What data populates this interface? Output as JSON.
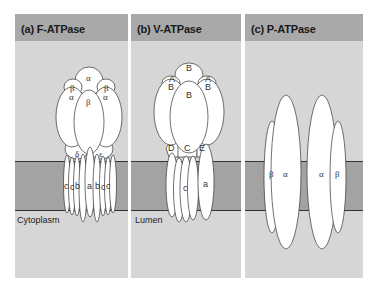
{
  "figure": {
    "panels": [
      {
        "id": "a",
        "title": "(a) F-ATPase",
        "side_label": "Cytoplasm",
        "subunits": [
          "α",
          "β",
          "α",
          "β",
          "α",
          "β",
          "δ",
          "ε",
          "c",
          "c",
          "b",
          "a",
          "b",
          "c",
          "c"
        ]
      },
      {
        "id": "b",
        "title": "(b) V-ATPase",
        "side_label": "Lumen",
        "subunits": [
          "B",
          "A",
          "B",
          "A",
          "B",
          "B",
          "D",
          "C",
          "E",
          "c",
          "a"
        ]
      },
      {
        "id": "c",
        "title": "(c) P-ATPase",
        "side_label": "",
        "subunits": [
          "β",
          "α",
          "α",
          "β"
        ]
      }
    ],
    "labels": {
      "a_alpha_top": "α",
      "a_beta_left": "β",
      "a_beta_right": "β",
      "a_alpha_left": "α",
      "a_alpha_right": "α",
      "a_beta_center": "β",
      "a_delta": "δ",
      "a_epsilon": "ε",
      "a_c1": "c",
      "a_c2": "c",
      "a_b1": "b",
      "a_a": "a",
      "a_b2": "b",
      "a_c3": "c",
      "a_c4": "c",
      "b_B_top": "B",
      "b_A_left": "A",
      "b_A_right": "A",
      "b_B_left": "B",
      "b_B_right": "B",
      "b_B_center": "B",
      "b_D": "D",
      "b_C": "C",
      "b_E": "E",
      "b_c": "c",
      "b_a": "a",
      "c_beta_left": "β",
      "c_alpha_left": "α",
      "c_alpha_right": "α",
      "c_beta_right": "β"
    },
    "colors": {
      "background": "#d6d6d6",
      "header": "#a9a9a9",
      "membrane": "#a3a3a3",
      "subunit_fill": "#ffffff",
      "outline": "#333333"
    }
  }
}
